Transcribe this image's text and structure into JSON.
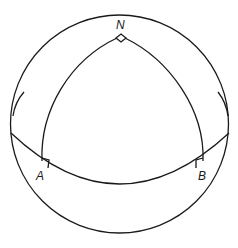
{
  "diagram": {
    "labels": {
      "north": "N",
      "a": "A",
      "b": "B"
    },
    "elements": [
      "sphere outline",
      "equator great circle",
      "meridian arc N-A",
      "meridian arc N-B",
      "right-angle marker at N",
      "right-angle marker at A",
      "right-angle marker at B"
    ],
    "colors": {
      "stroke": "#1a1a1a",
      "background": "#ffffff"
    }
  }
}
